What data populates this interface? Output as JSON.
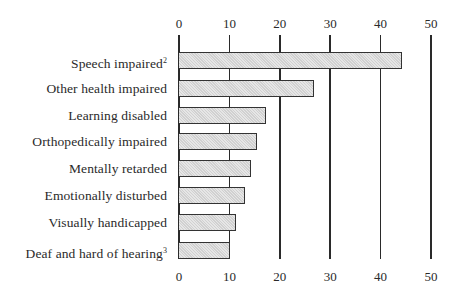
{
  "chart_data": {
    "type": "bar",
    "orientation": "horizontal",
    "title": "",
    "xlabel": "",
    "ylabel": "",
    "categories": [
      "Speech impaired",
      "Other health impaired",
      "Learning disabled",
      "Orthopedically impaired",
      "Mentally retarded",
      "Emotionally disturbed",
      "Visually handicapped",
      "Deaf and hard of hearing"
    ],
    "category_footnotes": [
      "2",
      "",
      "",
      "",
      "",
      "",
      "",
      "3"
    ],
    "values": [
      44.2,
      26.7,
      17.3,
      15.4,
      14.2,
      13.0,
      11.4,
      10.2
    ],
    "xlim": [
      0,
      50
    ],
    "xticks": [
      0,
      10,
      20,
      30,
      40,
      50
    ],
    "tick_labels_top": [
      "0",
      "10",
      "20",
      "30",
      "40",
      "50"
    ],
    "tick_labels_bottom": [
      "0",
      "10",
      "20",
      "30",
      "40",
      "50"
    ],
    "grid": true,
    "legend": null,
    "bar_fill": "#d9d9d9",
    "bar_edge": "#333333"
  },
  "labels": [
    {
      "text": "Speech impaired",
      "sup": "2"
    },
    {
      "text": "Other health impaired",
      "sup": ""
    },
    {
      "text": "Learning disabled",
      "sup": ""
    },
    {
      "text": "Orthopedically impaired",
      "sup": ""
    },
    {
      "text": "Mentally retarded",
      "sup": ""
    },
    {
      "text": "Emotionally disturbed",
      "sup": ""
    },
    {
      "text": "Visually handicapped",
      "sup": ""
    },
    {
      "text": "Deaf and hard of hearing",
      "sup": "3"
    }
  ]
}
